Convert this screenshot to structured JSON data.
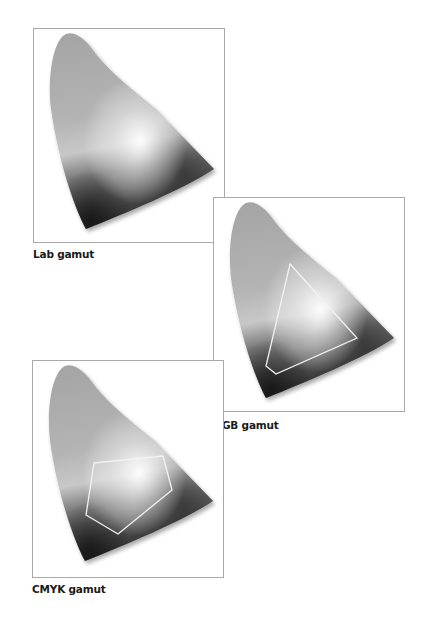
{
  "figures": [
    {
      "id": "lab",
      "label": "Lab gamut",
      "overlay": null
    },
    {
      "id": "rgb",
      "label": "RGB gamut",
      "overlay": "triangle"
    },
    {
      "id": "cmyk",
      "label": "CMYK gamut",
      "overlay": "pentagon"
    }
  ],
  "colors": {
    "panel_border": "#a9a9a9",
    "gamut_top": "#a6a6a6",
    "gamut_highlight": "#f4f4f4",
    "gamut_dark": "#333333",
    "overlay_stroke": "#f2f2f2"
  }
}
